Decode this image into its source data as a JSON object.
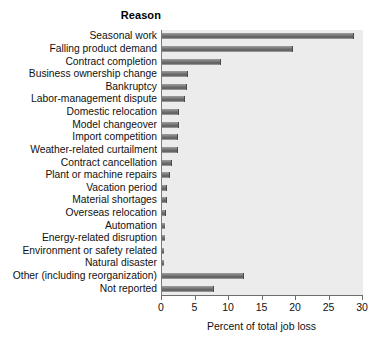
{
  "chart_data": {
    "type": "bar",
    "orientation": "horizontal",
    "title": "Reason",
    "xlabel": "Percent of total job loss",
    "ylabel": "",
    "xlim": [
      0,
      30
    ],
    "xticks": [
      0,
      5,
      10,
      15,
      20,
      25,
      30
    ],
    "xtick_labels": [
      "0",
      "5",
      "10",
      "15",
      "20",
      "25",
      "30"
    ],
    "grid": false,
    "legend": "none",
    "bar_color": "#777777",
    "plot_background": "#ececed",
    "categories": [
      "Seasonal work",
      "Falling product demand",
      "Contract completion",
      "Business ownership change",
      "Bankruptcy",
      "Labor-management dispute",
      "Domestic relocation",
      "Model changeover",
      "Import competition",
      "Weather-related curtailment",
      "Contract cancellation",
      "Plant or machine repairs",
      "Vacation period",
      "Material shortages",
      "Overseas relocation",
      "Automation",
      "Energy-related disruption",
      "Environment or safety related",
      "Natural disaster",
      "Other (including reorganization)",
      "Not reported"
    ],
    "values": [
      28.6,
      19.6,
      8.8,
      3.9,
      3.7,
      3.4,
      2.6,
      2.5,
      2.4,
      2.4,
      1.5,
      1.2,
      0.8,
      0.7,
      0.6,
      0.4,
      0.4,
      0.3,
      0.3,
      12.3,
      7.8
    ]
  }
}
